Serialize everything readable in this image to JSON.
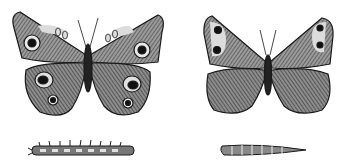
{
  "illustration": {
    "style": "engraving",
    "background": "#ffffff",
    "ink": "#1a1a1a",
    "wing_fill": "#8a8a8a",
    "light_fill": "#d8d8d8",
    "figures": [
      {
        "name": "buckeye-butterfly",
        "eyespots": 6
      },
      {
        "name": "wood-nymph-butterfly",
        "eyespots": 4
      },
      {
        "name": "spiny-caterpillar"
      },
      {
        "name": "smooth-caterpillar"
      }
    ]
  }
}
